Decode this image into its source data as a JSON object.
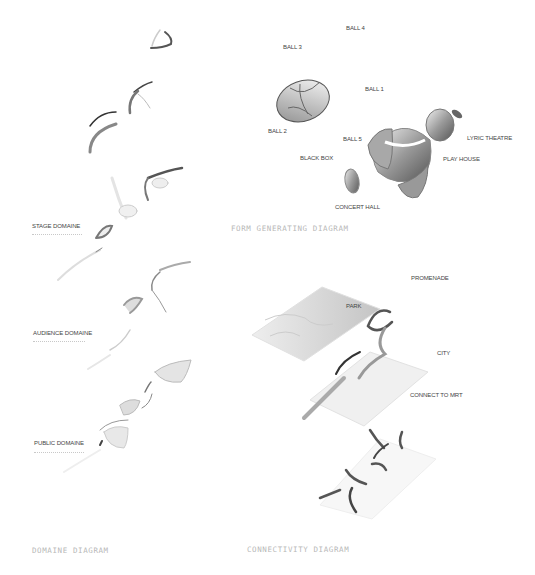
{
  "panels": {
    "domaine": {
      "title": "DOMAINE DIAGRAM",
      "labels": {
        "stage": "STAGE DOMAINE",
        "audience": "AUDIENCE DOMAINE",
        "public": "PUBLIC DOMAINE"
      }
    },
    "form": {
      "title": "FORM GENERATING DIAGRAM",
      "labels": {
        "ball4": "BALL 4",
        "ball3": "BALL 3",
        "ball1": "BALL 1",
        "ball2": "BALL 2",
        "ball5": "BALL 5",
        "lyric": "LYRIC THEATRE",
        "blackbox": "BLACK BOX",
        "playhouse": "PLAY HOUSE",
        "concert": "CONCERT HALL"
      }
    },
    "connectivity": {
      "title": "CONNECTIVITY DIAGRAM",
      "labels": {
        "promenade": "PROMENADE",
        "park": "PARK",
        "city": "CITY",
        "mrt": "CONNECT TO MRT"
      }
    }
  },
  "colors": {
    "background": "#ffffff",
    "label": "#444444",
    "title": "#b8b8b8",
    "form_dark": "#555555",
    "form_mid": "#999999",
    "form_light": "#dddddd"
  }
}
